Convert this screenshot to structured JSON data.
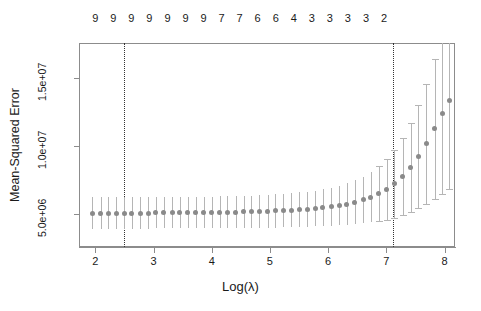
{
  "chart_data": {
    "type": "scatter",
    "title": "",
    "xlabel": "Log(λ)",
    "ylabel": "Mean-Squared Error",
    "xlim": [
      1.72,
      8.18
    ],
    "ylim": [
      2600000,
      17600000
    ],
    "grid": false,
    "legend": null,
    "x_ticks": [
      {
        "value": 2,
        "label": "2"
      },
      {
        "value": 3,
        "label": "3"
      },
      {
        "value": 4,
        "label": "4"
      },
      {
        "value": 5,
        "label": "5"
      },
      {
        "value": 6,
        "label": "6"
      },
      {
        "value": 7,
        "label": "7"
      },
      {
        "value": 8,
        "label": "8"
      }
    ],
    "y_ticks": [
      {
        "value": 5000000,
        "label": "5.0e+06"
      },
      {
        "value": 10000000,
        "label": "1.0e+07"
      },
      {
        "value": 15000000,
        "label": "1.5e+07"
      }
    ],
    "top_axis_label": "Number of non-zero coefficients",
    "top_ticks": [
      {
        "value": 2.0,
        "label": "9"
      },
      {
        "value": 2.31,
        "label": "9"
      },
      {
        "value": 2.62,
        "label": "9"
      },
      {
        "value": 2.93,
        "label": "9"
      },
      {
        "value": 3.24,
        "label": "9"
      },
      {
        "value": 3.55,
        "label": "9"
      },
      {
        "value": 3.86,
        "label": "9"
      },
      {
        "value": 4.17,
        "label": "7"
      },
      {
        "value": 4.48,
        "label": "7"
      },
      {
        "value": 4.79,
        "label": "6"
      },
      {
        "value": 5.1,
        "label": "6"
      },
      {
        "value": 5.41,
        "label": "4"
      },
      {
        "value": 5.72,
        "label": "3"
      },
      {
        "value": 6.03,
        "label": "3"
      },
      {
        "value": 6.34,
        "label": "3"
      },
      {
        "value": 6.65,
        "label": "3"
      },
      {
        "value": 6.96,
        "label": "2"
      }
    ],
    "vlines": [
      {
        "name": "lambda.min",
        "x": 2.5
      },
      {
        "name": "lambda.1se",
        "x": 7.11
      }
    ],
    "series_name": "cv-mean-squared-error",
    "point_color": "#8a8a8a",
    "errorbar_color": "#b5b5b5",
    "points": [
      {
        "x": 1.95,
        "mse": 5100000,
        "lo": 3950000,
        "hi": 6250000
      },
      {
        "x": 2.09,
        "mse": 5100000,
        "lo": 3950000,
        "hi": 6250000
      },
      {
        "x": 2.22,
        "mse": 5100000,
        "lo": 3950000,
        "hi": 6250000
      },
      {
        "x": 2.36,
        "mse": 5100000,
        "lo": 3950000,
        "hi": 6250000
      },
      {
        "x": 2.5,
        "mse": 5100000,
        "lo": 3950000,
        "hi": 6250000
      },
      {
        "x": 2.63,
        "mse": 5100000,
        "lo": 3950000,
        "hi": 6250000
      },
      {
        "x": 2.77,
        "mse": 5100000,
        "lo": 3950000,
        "hi": 6250000
      },
      {
        "x": 2.91,
        "mse": 5100000,
        "lo": 3950000,
        "hi": 6250000
      },
      {
        "x": 3.04,
        "mse": 5110000,
        "lo": 3960000,
        "hi": 6260000
      },
      {
        "x": 3.18,
        "mse": 5110000,
        "lo": 3960000,
        "hi": 6260000
      },
      {
        "x": 3.32,
        "mse": 5110000,
        "lo": 3960000,
        "hi": 6270000
      },
      {
        "x": 3.45,
        "mse": 5120000,
        "lo": 3960000,
        "hi": 6280000
      },
      {
        "x": 3.59,
        "mse": 5120000,
        "lo": 3960000,
        "hi": 6280000
      },
      {
        "x": 3.73,
        "mse": 5130000,
        "lo": 3970000,
        "hi": 6290000
      },
      {
        "x": 3.86,
        "mse": 5130000,
        "lo": 3970000,
        "hi": 6300000
      },
      {
        "x": 4.0,
        "mse": 5140000,
        "lo": 3970000,
        "hi": 6310000
      },
      {
        "x": 4.14,
        "mse": 5150000,
        "lo": 3980000,
        "hi": 6320000
      },
      {
        "x": 4.27,
        "mse": 5160000,
        "lo": 3980000,
        "hi": 6340000
      },
      {
        "x": 4.41,
        "mse": 5170000,
        "lo": 3990000,
        "hi": 6350000
      },
      {
        "x": 4.55,
        "mse": 5180000,
        "lo": 3990000,
        "hi": 6370000
      },
      {
        "x": 4.68,
        "mse": 5190000,
        "lo": 4000000,
        "hi": 6380000
      },
      {
        "x": 4.82,
        "mse": 5210000,
        "lo": 4010000,
        "hi": 6410000
      },
      {
        "x": 4.96,
        "mse": 5230000,
        "lo": 4020000,
        "hi": 6440000
      },
      {
        "x": 5.09,
        "mse": 5250000,
        "lo": 4030000,
        "hi": 6470000
      },
      {
        "x": 5.23,
        "mse": 5270000,
        "lo": 4040000,
        "hi": 6500000
      },
      {
        "x": 5.37,
        "mse": 5300000,
        "lo": 4050000,
        "hi": 6550000
      },
      {
        "x": 5.5,
        "mse": 5340000,
        "lo": 4070000,
        "hi": 6610000
      },
      {
        "x": 5.64,
        "mse": 5380000,
        "lo": 4090000,
        "hi": 6670000
      },
      {
        "x": 5.78,
        "mse": 5430000,
        "lo": 4110000,
        "hi": 6750000
      },
      {
        "x": 5.91,
        "mse": 5490000,
        "lo": 4130000,
        "hi": 6850000
      },
      {
        "x": 6.05,
        "mse": 5560000,
        "lo": 4160000,
        "hi": 6960000
      },
      {
        "x": 6.19,
        "mse": 5650000,
        "lo": 4190000,
        "hi": 7110000
      },
      {
        "x": 6.32,
        "mse": 5760000,
        "lo": 4230000,
        "hi": 7290000
      },
      {
        "x": 6.46,
        "mse": 5890000,
        "lo": 4280000,
        "hi": 7500000
      },
      {
        "x": 6.6,
        "mse": 6060000,
        "lo": 4340000,
        "hi": 7780000
      },
      {
        "x": 6.73,
        "mse": 6260000,
        "lo": 4410000,
        "hi": 8110000
      },
      {
        "x": 6.87,
        "mse": 6520000,
        "lo": 4500000,
        "hi": 8540000
      },
      {
        "x": 7.01,
        "mse": 6850000,
        "lo": 4620000,
        "hi": 9080000
      },
      {
        "x": 7.14,
        "mse": 7260000,
        "lo": 4760000,
        "hi": 9760000
      },
      {
        "x": 7.28,
        "mse": 7780000,
        "lo": 4940000,
        "hi": 10620000
      },
      {
        "x": 7.42,
        "mse": 8430000,
        "lo": 5160000,
        "hi": 11700000
      },
      {
        "x": 7.55,
        "mse": 9230000,
        "lo": 5440000,
        "hi": 13020000
      },
      {
        "x": 7.69,
        "mse": 10180000,
        "lo": 5760000,
        "hi": 14600000
      },
      {
        "x": 7.83,
        "mse": 11280000,
        "lo": 6140000,
        "hi": 16420000
      },
      {
        "x": 7.96,
        "mse": 12400000,
        "lo": 6520000,
        "hi": 18280000
      },
      {
        "x": 8.08,
        "mse": 13400000,
        "lo": 6850000,
        "hi": 19950000
      }
    ]
  }
}
